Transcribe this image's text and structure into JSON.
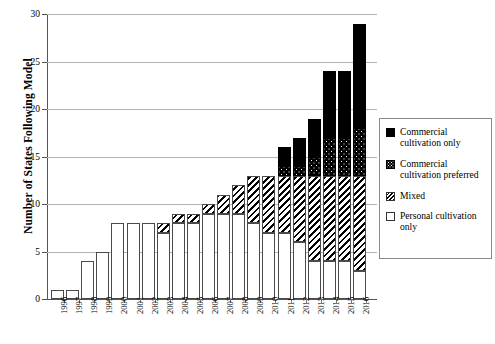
{
  "chart_data": {
    "type": "bar",
    "stacked": true,
    "title": "",
    "xlabel": "",
    "ylabel": "Number of States Following Model",
    "ylim": [
      0,
      30
    ],
    "yticks": [
      0,
      5,
      10,
      15,
      20,
      25,
      30
    ],
    "grid": true,
    "legend_position": "right",
    "categories": [
      "1996",
      "1997",
      "1998",
      "1999",
      "2000",
      "2001",
      "2002",
      "2003",
      "2004",
      "2005",
      "2006",
      "2007",
      "2008",
      "2009",
      "2010",
      "2011",
      "2012",
      "2013",
      "2014",
      "2015",
      "2016"
    ],
    "series": [
      {
        "name": "Personal cultivation only",
        "fill": "white",
        "values": [
          1,
          1,
          4,
          5,
          8,
          8,
          8,
          7,
          8,
          8,
          9,
          9,
          9,
          8,
          7,
          7,
          6,
          4,
          4,
          4,
          3
        ]
      },
      {
        "name": "Mixed",
        "fill": "diagonal-hatch",
        "values": [
          0,
          0,
          0,
          0,
          0,
          0,
          0,
          1,
          1,
          1,
          1,
          2,
          3,
          5,
          6,
          6,
          7,
          9,
          9,
          9,
          10
        ]
      },
      {
        "name": "Commercial cultivation preferred",
        "fill": "black-with-white-dots",
        "values": [
          0,
          0,
          0,
          0,
          0,
          0,
          0,
          0,
          0,
          0,
          0,
          0,
          0,
          0,
          0,
          1,
          1,
          2,
          4,
          4,
          5
        ]
      },
      {
        "name": "Commercial cultivation only",
        "fill": "solid-black",
        "values": [
          0,
          0,
          0,
          0,
          0,
          0,
          0,
          0,
          0,
          0,
          0,
          0,
          0,
          0,
          0,
          2,
          3,
          4,
          7,
          7,
          11
        ]
      }
    ],
    "totals": [
      1,
      1,
      4,
      5,
      8,
      8,
      8,
      8,
      9,
      9,
      10,
      11,
      12,
      13,
      13,
      16,
      17,
      19,
      24,
      24,
      29
    ]
  },
  "axis": {
    "y_title": "Number of States Following Model",
    "y_ticks": [
      "0",
      "5",
      "10",
      "15",
      "20",
      "25",
      "30"
    ],
    "x_ticks": [
      "1996",
      "1997",
      "1998",
      "1999",
      "2000",
      "2001",
      "2002",
      "2003",
      "2004",
      "2005",
      "2006",
      "2007",
      "2008",
      "2009",
      "2010",
      "2011",
      "2012",
      "2013",
      "2014",
      "2015",
      "2016"
    ]
  },
  "legend": {
    "items": [
      {
        "label_line1": "Commercial",
        "label_line2": "cultivation only",
        "swatch": "solid-black-swatch"
      },
      {
        "label_line1": "Commercial",
        "label_line2": "cultivation preferred",
        "swatch": "dotted-black-swatch"
      },
      {
        "label_line1": "Mixed",
        "label_line2": "",
        "swatch": "hatched-swatch"
      },
      {
        "label_line1": "Personal cultivation",
        "label_line2": "only",
        "swatch": "white-swatch"
      }
    ]
  },
  "colors": {
    "ink": "#000000",
    "axis": "#555555",
    "gridline": "#b4b4b4",
    "bar_outline": "#4a4a4a",
    "background": "#ffffff"
  }
}
